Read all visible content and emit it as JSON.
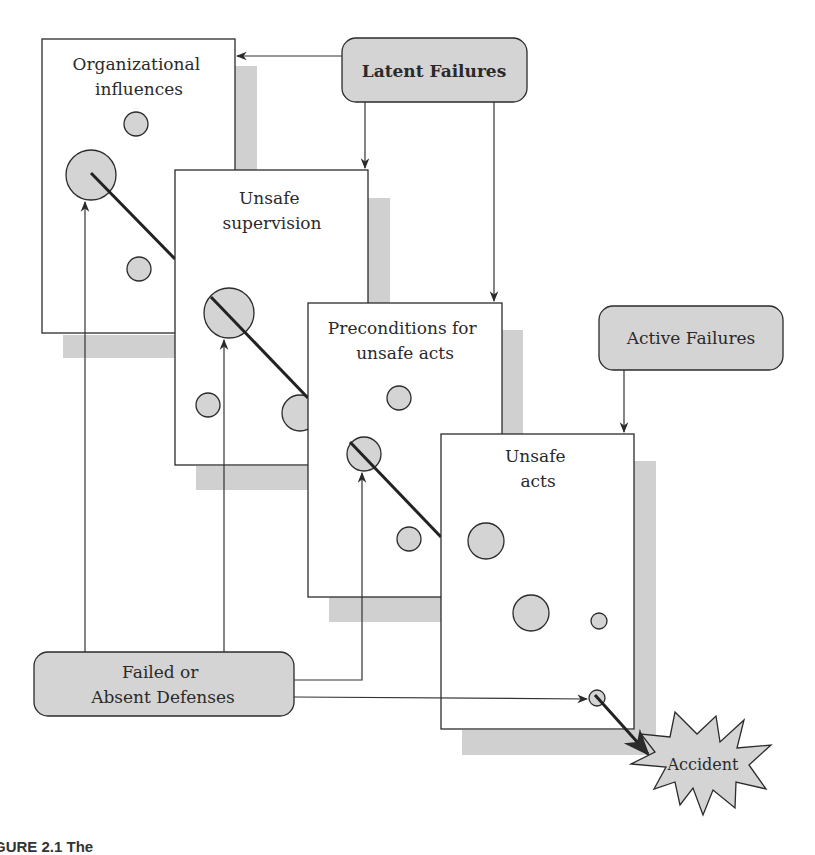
{
  "diagram": {
    "layers": [
      {
        "id": "organizational",
        "label_lines": [
          "Organizational",
          "influences"
        ]
      },
      {
        "id": "supervision",
        "label_lines": [
          "Unsafe",
          "supervision"
        ]
      },
      {
        "id": "preconditions",
        "label_lines": [
          "Preconditions for",
          "unsafe acts"
        ]
      },
      {
        "id": "unsafe_acts",
        "label_lines": [
          "Unsafe",
          "acts"
        ]
      }
    ],
    "callouts": {
      "latent": "Latent Failures",
      "active": "Active Failures",
      "defenses_lines": [
        "Failed or",
        "Absent Defenses"
      ]
    },
    "outcome": "Accident",
    "caption_fragment": "GURE 2.1   The"
  },
  "colors": {
    "fill_gray": "#d4d4d4",
    "shadow_gray": "#d0d0d0",
    "stroke": "#2b2b2b",
    "background": "#ffffff"
  }
}
